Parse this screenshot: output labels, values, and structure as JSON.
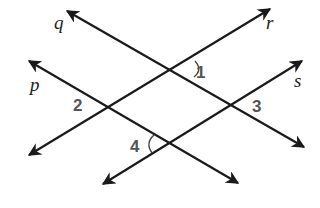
{
  "diagram": {
    "colors": {
      "line": "#1a1a1a",
      "line_label": "#222222",
      "angle_label": "#555555",
      "background": "#ffffff"
    },
    "lines": [
      {
        "name": "q",
        "label": "q",
        "from": [
          67,
          11
        ],
        "to": [
          304,
          147
        ]
      },
      {
        "name": "p",
        "label": "p",
        "from": [
          29,
          61
        ],
        "to": [
          238,
          183
        ]
      },
      {
        "name": "r",
        "label": "r",
        "from": [
          270,
          9
        ],
        "to": [
          29,
          155
        ]
      },
      {
        "name": "s",
        "label": "s",
        "from": [
          302,
          61
        ],
        "to": [
          103,
          184
        ]
      }
    ],
    "line_labels": {
      "q": "q",
      "p": "p",
      "r": "r",
      "s": "s"
    },
    "angles": [
      {
        "label": "1",
        "vertex": [
          181,
          69
        ],
        "lines": [
          "q",
          "r"
        ],
        "arc": true
      },
      {
        "label": "2",
        "vertex": [
          107,
          107
        ],
        "lines": [
          "p",
          "r"
        ],
        "arc": false
      },
      {
        "label": "3",
        "vertex": [
          230,
          106
        ],
        "lines": [
          "q",
          "s"
        ],
        "arc": false
      },
      {
        "label": "4",
        "vertex": [
          168,
          143
        ],
        "lines": [
          "p",
          "s"
        ],
        "arc": true
      }
    ],
    "angle_labels": {
      "a1": "1",
      "a2": "2",
      "a3": "3",
      "a4": "4"
    }
  }
}
